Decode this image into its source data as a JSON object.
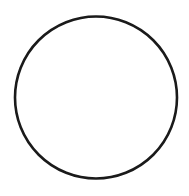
{
  "diagram": {
    "shape": "circle",
    "center": [
      96,
      97.5
    ],
    "radius": 81,
    "stroke_color": "#1a1a1a",
    "stroke_width": 2.6,
    "fill": "#ffffff",
    "background": "#ffffff"
  }
}
